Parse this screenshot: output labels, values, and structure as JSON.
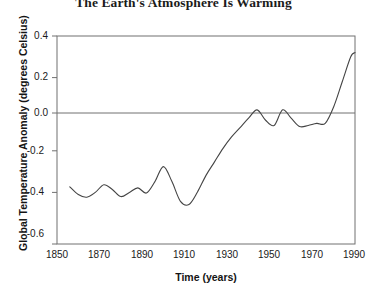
{
  "chart_data": {
    "type": "line",
    "title": "The Earth's Atmosphere Is Warming",
    "xlabel": "Time (years)",
    "ylabel": "Global Temperature Anomaly (degrees Celsius)",
    "xlim": [
      1850,
      1990
    ],
    "ylim": [
      -0.6,
      0.4
    ],
    "xticks": [
      1850,
      1870,
      1890,
      1910,
      1930,
      1950,
      1970,
      1990
    ],
    "xtick_labels": [
      "1850",
      "1870",
      "1890",
      "1910",
      "1930",
      "1950",
      "1970",
      "1990"
    ],
    "yticks": [
      0.4,
      0.2,
      0.0,
      -0.2,
      -0.4,
      -0.6
    ],
    "ytick_labels": [
      "0.4",
      "0.2",
      "0.0",
      "-0.2",
      "-0.4",
      "-0.6"
    ],
    "grid": false,
    "legend": "none",
    "line_color": "#444444",
    "axis_color": "#666666",
    "zero_reference_line": 0.0,
    "series": [
      {
        "name": "Global Temperature Anomaly",
        "x": [
          1856,
          1860,
          1864,
          1868,
          1872,
          1876,
          1880,
          1884,
          1888,
          1892,
          1896,
          1900,
          1904,
          1908,
          1912,
          1916,
          1920,
          1924,
          1928,
          1932,
          1936,
          1940,
          1944,
          1948,
          1952,
          1956,
          1960,
          1964,
          1968,
          1972,
          1976,
          1980,
          1984,
          1988
        ],
        "y": [
          -0.325,
          -0.362,
          -0.375,
          -0.352,
          -0.315,
          -0.338,
          -0.372,
          -0.352,
          -0.33,
          -0.355,
          -0.3,
          -0.228,
          -0.3,
          -0.395,
          -0.41,
          -0.35,
          -0.27,
          -0.205,
          -0.14,
          -0.085,
          -0.04,
          0.005,
          0.045,
          -0.005,
          -0.03,
          0.045,
          0.005,
          -0.035,
          -0.03,
          -0.02,
          -0.02,
          0.06,
          0.18,
          0.3
        ],
        "y_end": 0.32,
        "x_end": 1990
      }
    ]
  }
}
